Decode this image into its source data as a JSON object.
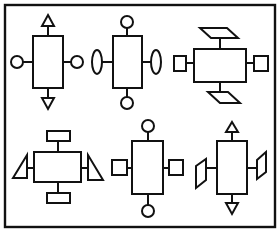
{
  "diagram": {
    "title": "",
    "colors": {
      "stroke": "#111111",
      "fill": "#ffffff",
      "background": "#ffffff"
    },
    "figures": [
      {
        "id": 1,
        "position": "top-left",
        "center": "rectangle-vertical",
        "top": "triangle-up",
        "bottom": "triangle-down",
        "left": "circle",
        "right": "circle"
      },
      {
        "id": 2,
        "position": "top-middle",
        "center": "rectangle-vertical",
        "top": "circle",
        "bottom": "circle",
        "left": "ellipse-vertical",
        "right": "ellipse-vertical"
      },
      {
        "id": 3,
        "position": "top-right",
        "center": "rectangle-horizontal",
        "top": "parallelogram",
        "bottom": "parallelogram",
        "left": "square",
        "right": "square"
      },
      {
        "id": 4,
        "position": "bottom-left",
        "center": "rectangle-horizontal",
        "top": "small-rectangle",
        "bottom": "small-rectangle",
        "left": "right-triangle",
        "right": "right-triangle"
      },
      {
        "id": 5,
        "position": "bottom-middle",
        "center": "rectangle-vertical",
        "top": "circle",
        "bottom": "circle",
        "left": "square",
        "right": "square"
      },
      {
        "id": 6,
        "position": "bottom-right",
        "center": "rectangle-vertical",
        "top": "triangle-up",
        "bottom": "triangle-down",
        "left": "parallelogram-vertical",
        "right": "parallelogram-vertical"
      }
    ]
  }
}
